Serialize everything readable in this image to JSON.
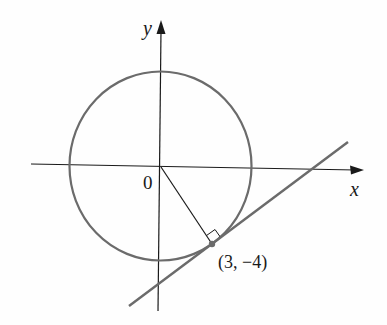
{
  "diagram": {
    "axes": {
      "x_label": "x",
      "y_label": "y",
      "origin_label": "0"
    },
    "point": {
      "label": "(3, −4)",
      "x": 3,
      "y": -4
    },
    "colors": {
      "axis": "#1a1a1a",
      "circle": "#6b6b6b",
      "tangent": "#6b6b6b",
      "radius": "#1a1a1a",
      "point": "#6b6b6b"
    }
  }
}
